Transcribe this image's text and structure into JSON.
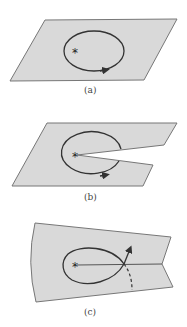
{
  "figure": {
    "panels": [
      {
        "id": "a",
        "label": "(a)",
        "description": "Flat sheet (parallelogram) with a closed loop encircling a singular point",
        "marker": "*"
      },
      {
        "id": "b",
        "label": "(b)",
        "description": "Sheet with a wedge cut from the singular point to the edge; loop is interrupted by the cut",
        "marker": "*"
      },
      {
        "id": "c",
        "label": "(c)",
        "description": "Curved sheet with a branch cut line from the singular point; loop crosses the cut and continues (dashed) onto another sheet",
        "marker": "*"
      }
    ]
  },
  "colors": {
    "sheet_fill": "#d9d9d9",
    "sheet_stroke": "#777777",
    "curve": "#333333",
    "background": "#ffffff"
  }
}
